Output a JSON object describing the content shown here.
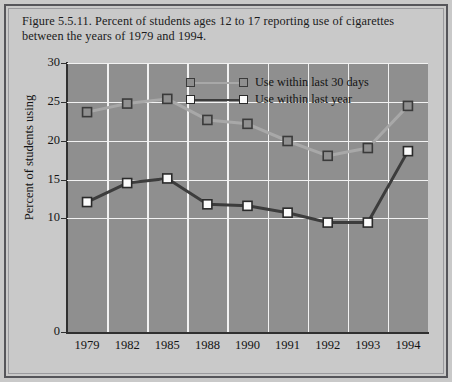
{
  "figure": {
    "caption": "Figure 5.5.11. Percent of students ages 12 to 17 reporting use of cigarettes between the years of 1979 and 1994."
  },
  "colors": {
    "page_background": "#c9c9c9",
    "plot_background": "#8f8f8f",
    "gridline": "#f2f2f2",
    "axis": "#303030",
    "series_30days": "#a8a8a8",
    "series_year": "#3c3c3c",
    "marker_30days_fill": "#8f8f8f",
    "marker_year_fill": "#fbfbfb",
    "frame": "#55555a",
    "text": "#141414"
  },
  "chart_data": {
    "type": "line",
    "title": "Figure 5.5.11. Percent of students ages 12 to 17 reporting use of cigarettes between the years of 1979 and 1994.",
    "xlabel": "",
    "ylabel": "Percent of students using",
    "categories": [
      "1979",
      "1982",
      "1985",
      "1988",
      "1990",
      "1991",
      "1992",
      "1993",
      "1994"
    ],
    "ytick_labels": [
      "0",
      "10",
      "15",
      "20",
      "25",
      "30"
    ],
    "ytick_values": [
      0,
      10,
      15,
      20,
      25,
      30
    ],
    "ylim": [
      0,
      30
    ],
    "axis_note": "Y axis tick spacing is non-uniform: the 0-to-10 band is drawn wider than each 5-unit band above it.",
    "grid": "horizontal and vertical white gridlines",
    "legend_position": "inside top center",
    "series": [
      {
        "name": "Use within last 30 days",
        "marker": "open-square",
        "values": [
          23.7,
          24.8,
          25.4,
          22.7,
          22.2,
          20.0,
          18.1,
          19.1,
          24.5
        ]
      },
      {
        "name": "Use within last year",
        "marker": "white-square",
        "values": [
          12.1,
          14.6,
          15.2,
          11.8,
          11.6,
          10.7,
          9.6,
          9.6,
          18.7
        ]
      }
    ]
  },
  "legend": {
    "items": [
      {
        "label": "Use within last 30 days"
      },
      {
        "label": "Use within last year"
      }
    ]
  }
}
